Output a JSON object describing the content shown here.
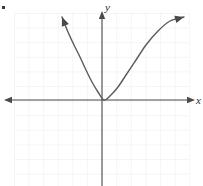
{
  "figure": {
    "name": "coordinate-plane-parabola",
    "width": 203,
    "height": 186,
    "background_color": "#ffffff"
  },
  "axes": {
    "x_label": "x",
    "y_label": "y",
    "axis_color": "#4a4a4a",
    "origin": {
      "x": 102,
      "y": 100
    },
    "x_axis": {
      "start_x": 6,
      "end_x": 193,
      "y": 100,
      "arrow_left": true,
      "arrow_right": true
    },
    "y_axis": {
      "x": 102,
      "start_y": 13,
      "end_y": 186,
      "arrow_up": true,
      "arrow_down": false
    }
  },
  "grid": {
    "color": "#ececed",
    "cell_size": 14.6,
    "left": 14,
    "top": 13,
    "right": 190,
    "bottom": 186,
    "visible": true
  },
  "curve": {
    "type": "parabola",
    "orientation": "opens-upward",
    "color": "#5a5a5a",
    "stroke_width": 1.4,
    "vertex": {
      "x": 104,
      "y": 100
    },
    "left_arrow_tip": {
      "x": 62,
      "y": 17
    },
    "right_arrow_tip": {
      "x": 184,
      "y": 17
    },
    "y_intercept": {
      "x": 102,
      "y": 100
    },
    "arrow_both_ends": true
  },
  "chart_data": {
    "type": "line",
    "title": "",
    "xlabel": "x",
    "ylabel": "y",
    "grid": true,
    "legend": "none",
    "annotations": [],
    "series": [
      {
        "name": "parabola",
        "points_px": [
          [
            62,
            17
          ],
          [
            68,
            32
          ],
          [
            74,
            45
          ],
          [
            80,
            57
          ],
          [
            86,
            70
          ],
          [
            92,
            82
          ],
          [
            98,
            92
          ],
          [
            104,
            100
          ],
          [
            110,
            96
          ],
          [
            118,
            87
          ],
          [
            126,
            75
          ],
          [
            136,
            60
          ],
          [
            146,
            45
          ],
          [
            158,
            31
          ],
          [
            170,
            21
          ],
          [
            184,
            17
          ]
        ]
      }
    ]
  },
  "artifacts": {
    "speck": {
      "x": 2,
      "y": 6,
      "color": "#3a3a3a",
      "width": 3,
      "height": 3
    }
  }
}
